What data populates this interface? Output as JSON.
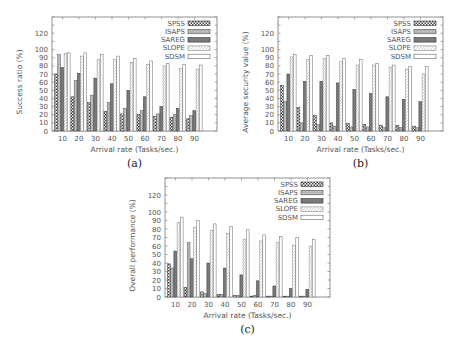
{
  "figure": {
    "legend": [
      "SPSS",
      "ISAPS",
      "SAREG",
      "SLOPE",
      "SDSM"
    ],
    "xlabel": "Arrival rate (Tasks/sec.)"
  },
  "chart_data": [
    {
      "type": "bar",
      "caption": "(a)",
      "title": "",
      "xlabel": "Arrival rate (Tasks/sec.)",
      "ylabel": "Success ratio (%)",
      "ylim": [
        0,
        140
      ],
      "yticks": [
        0,
        10,
        20,
        30,
        40,
        50,
        60,
        70,
        80,
        90,
        100,
        120
      ],
      "categories": [
        "10",
        "20",
        "30",
        "40",
        "50",
        "60",
        "70",
        "80",
        "90"
      ],
      "legend_position": "upper right",
      "series": [
        {
          "name": "SPSS",
          "values": [
            70,
            42,
            35,
            24,
            21,
            20,
            18,
            17,
            15
          ]
        },
        {
          "name": "ISAPS",
          "values": [
            94,
            62,
            44,
            35,
            28,
            25,
            21,
            20,
            19
          ]
        },
        {
          "name": "SAREG",
          "values": [
            78,
            71,
            65,
            58,
            50,
            42,
            30,
            28,
            25
          ]
        },
        {
          "name": "SLOPE",
          "values": [
            95,
            92,
            88,
            88,
            84,
            82,
            80,
            77,
            76
          ]
        },
        {
          "name": "SDSM",
          "values": [
            96,
            96,
            94,
            92,
            89,
            86,
            83,
            82,
            81
          ]
        }
      ]
    },
    {
      "type": "bar",
      "caption": "(b)",
      "title": "",
      "xlabel": "Arrival rate (Tasks/sec.)",
      "ylabel": "Average security value (%)",
      "ylim": [
        0,
        140
      ],
      "yticks": [
        0,
        10,
        20,
        30,
        40,
        50,
        60,
        70,
        80,
        90,
        100,
        120
      ],
      "categories": [
        "10",
        "20",
        "30",
        "40",
        "50",
        "60",
        "70",
        "80",
        "90"
      ],
      "legend_position": "upper right",
      "series": [
        {
          "name": "SPSS",
          "values": [
            56,
            29,
            19,
            10,
            9,
            8,
            7,
            7,
            6
          ]
        },
        {
          "name": "ISAPS",
          "values": [
            36,
            10,
            8,
            6,
            5,
            5,
            4,
            4,
            4
          ]
        },
        {
          "name": "SAREG",
          "values": [
            70,
            61,
            61,
            59,
            51,
            46,
            42,
            39,
            36
          ]
        },
        {
          "name": "SLOPE",
          "values": [
            91,
            88,
            89,
            85,
            81,
            81,
            78,
            76,
            70
          ]
        },
        {
          "name": "SDSM",
          "values": [
            94,
            93,
            93,
            89,
            88,
            83,
            81,
            79,
            79
          ]
        }
      ]
    },
    {
      "type": "bar",
      "caption": "(c)",
      "title": "",
      "xlabel": "Arrival rate (Tasks/sec.)",
      "ylabel": "Overall performance (%)",
      "ylim": [
        0,
        140
      ],
      "yticks": [
        0,
        10,
        20,
        30,
        40,
        50,
        60,
        70,
        80,
        90,
        100,
        120
      ],
      "categories": [
        "10",
        "20",
        "30",
        "40",
        "50",
        "60",
        "70",
        "80",
        "90"
      ],
      "legend_position": "upper right",
      "series": [
        {
          "name": "SPSS",
          "values": [
            39,
            11,
            6,
            3,
            2,
            1,
            1,
            1,
            1
          ]
        },
        {
          "name": "ISAPS",
          "values": [
            34,
            64,
            4,
            3,
            2,
            2,
            1,
            1,
            1
          ]
        },
        {
          "name": "SAREG",
          "values": [
            54,
            45,
            40,
            34,
            26,
            19,
            13,
            10,
            9
          ]
        },
        {
          "name": "SLOPE",
          "values": [
            88,
            82,
            78,
            75,
            68,
            66,
            64,
            61,
            60
          ]
        },
        {
          "name": "SDSM",
          "values": [
            94,
            90,
            86,
            83,
            79,
            73,
            71,
            70,
            68
          ]
        }
      ]
    }
  ]
}
